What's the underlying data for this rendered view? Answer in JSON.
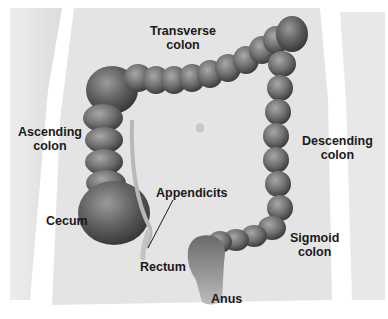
{
  "diagram": {
    "labels": [
      {
        "id": "transverse",
        "line1": "Transverse",
        "line2": "colon"
      },
      {
        "id": "ascending",
        "line1": "Ascending",
        "line2": "colon"
      },
      {
        "id": "descending",
        "line1": "Descending",
        "line2": "colon"
      },
      {
        "id": "appendicits",
        "line1": "Appendicits"
      },
      {
        "id": "cecum",
        "line1": "Cecum"
      },
      {
        "id": "rectum",
        "line1": "Rectum"
      },
      {
        "id": "sigmoid",
        "line1": "Sigmoid",
        "line2": "colon"
      },
      {
        "id": "anus",
        "line1": "Anus"
      }
    ],
    "colors": {
      "skin": "#e6e6e6",
      "skin_shadow": "#cfcfcf",
      "colon_light": "#9a9a9a",
      "colon_mid": "#6e6e6e",
      "colon_dark": "#3e3e3e",
      "text": "#1a1a1a"
    }
  }
}
